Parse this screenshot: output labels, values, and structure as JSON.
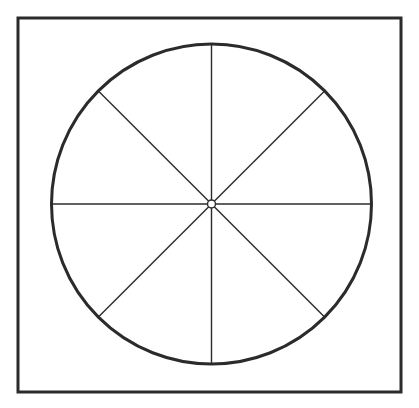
{
  "figure": {
    "type": "geometric-diagram",
    "canvas": {
      "width": 419,
      "height": 408,
      "background_color": "#ffffff"
    },
    "frame": {
      "name": "square-border",
      "x": 18,
      "y": 18,
      "width": 383,
      "height": 374,
      "stroke_color": "#2b2b2b",
      "stroke_width": 3,
      "fill_color": "#ffffff"
    },
    "circle": {
      "name": "outer-circle",
      "center_x": 211.5,
      "center_y": 204,
      "radius": 160,
      "stroke_color": "#2b2b2b",
      "stroke_width": 3,
      "fill_color": "#ffffff"
    },
    "hub": {
      "name": "center-hub",
      "center_x": 211.5,
      "center_y": 204,
      "radius": 4,
      "stroke_color": "#2b2b2b",
      "stroke_width": 1.4,
      "fill_color": "#ffffff"
    },
    "divider_lines": {
      "count": 4,
      "sector_count": 8,
      "sector_angle_degrees": 45,
      "stroke_color": "#2b2b2b",
      "stroke_width": 1.4,
      "angles_degrees": [
        0,
        45,
        90,
        135
      ],
      "lines": [
        {
          "name": "vertical-diameter",
          "angle_degrees": 90,
          "x1": 211.5,
          "y1": 44,
          "x2": 211.5,
          "y2": 364
        },
        {
          "name": "horizontal-diameter",
          "angle_degrees": 0,
          "x1": 51.5,
          "y1": 204,
          "x2": 371.5,
          "y2": 204
        },
        {
          "name": "diagonal-diameter-nw-se",
          "angle_degrees": 135,
          "x1": 98.4,
          "y1": 90.9,
          "x2": 324.6,
          "y2": 317.1
        },
        {
          "name": "diagonal-diameter-ne-sw",
          "angle_degrees": 45,
          "x1": 324.6,
          "y1": 90.9,
          "x2": 98.4,
          "y2": 317.1
        }
      ]
    }
  }
}
